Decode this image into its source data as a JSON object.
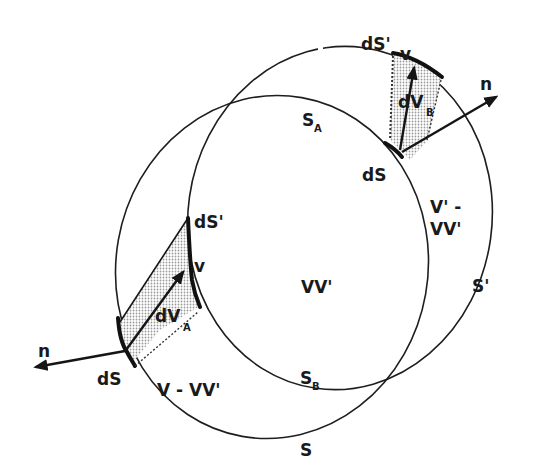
{
  "figure": {
    "regions": {
      "intersection": "VV'",
      "v_only": "V - VV'",
      "vprime_only_line1": "V' -",
      "vprime_only_line2": "VV'"
    },
    "surfaces": {
      "s": "S",
      "s_prime": "S'",
      "s_a": {
        "base": "S",
        "sub": "A"
      },
      "s_b": {
        "base": "S",
        "sub": "B"
      }
    },
    "left_element": {
      "ds": "dS",
      "ds_prime": "dS'",
      "velocity": "v",
      "normal": "n",
      "volume": {
        "base": "dV",
        "sub": "A"
      }
    },
    "right_element": {
      "ds": "dS",
      "ds_prime": "dS'",
      "velocity": "v",
      "normal": "n",
      "volume": {
        "base": "dV",
        "sub": "B"
      }
    },
    "colors": {
      "line": "#1e1e1e",
      "shading": "#bdbdbd",
      "background": "#ffffff"
    }
  }
}
